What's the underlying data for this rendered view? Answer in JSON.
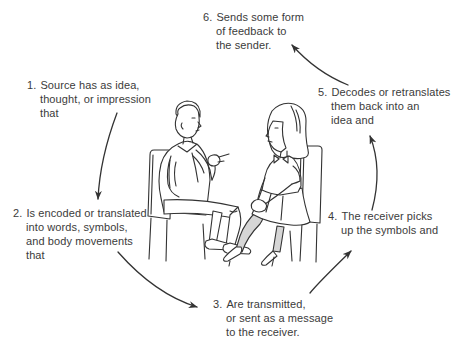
{
  "colors": {
    "background": "#ffffff",
    "text": "#3b3b3b",
    "line": "#333333",
    "stocking_shade": "#d6d6d6"
  },
  "steps": [
    {
      "number": "1.",
      "lines": [
        "Source has as idea,",
        "thought, or impression",
        "that"
      ]
    },
    {
      "number": "2.",
      "lines": [
        "Is encoded or translated",
        "into words, symbols,",
        "and body movements",
        "that"
      ]
    },
    {
      "number": "3.",
      "lines": [
        "Are transmitted,",
        "or sent as a message",
        "to the receiver."
      ]
    },
    {
      "number": "4.",
      "lines": [
        "The receiver picks",
        "up the symbols and"
      ]
    },
    {
      "number": "5.",
      "lines": [
        "Decodes or retranslates",
        "them back into an",
        "idea and"
      ]
    },
    {
      "number": "6.",
      "lines": [
        "Sends some form",
        "of feedback to",
        "the sender."
      ]
    }
  ],
  "connections": [
    {
      "from": 1,
      "to": 2
    },
    {
      "from": 2,
      "to": 3
    },
    {
      "from": 3,
      "to": 4
    },
    {
      "from": 4,
      "to": 5
    },
    {
      "from": 5,
      "to": 6
    }
  ],
  "illustration": {
    "name": "two-people-conversation",
    "description": "Line drawing of a man and a woman seated on chairs facing each other in conversation; man gesturing with pointing finger, woman with hands clasped on crossed knee"
  }
}
